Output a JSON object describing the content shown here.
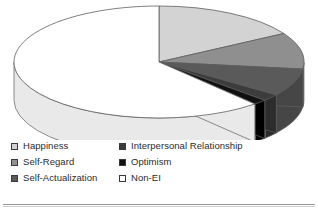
{
  "chart_data": {
    "type": "pie",
    "title": "",
    "three_d": true,
    "legend_position": "bottom",
    "categories": [
      "Happiness",
      "Self-Regard",
      "Self-Actualization",
      "Interpersonal Relationship",
      "Optimism",
      "Non-EI"
    ],
    "values": [
      16.5,
      10.5,
      8.0,
      2.0,
      1.5,
      61.5
    ],
    "unit": "percent",
    "colors": [
      "#d3d3d3",
      "#8f8f8f",
      "#5a5a5a",
      "#3c3c3c",
      "#111111",
      "#ffffff"
    ],
    "side_colors": [
      "#b5b5b5",
      "#737373",
      "#464646",
      "#2c2c2c",
      "#000000",
      "#e9e9e9"
    ],
    "start_angle_deg": -90,
    "direction": "clockwise",
    "outline_color": "#5e5e5e"
  },
  "legend": {
    "columns": [
      {
        "items": [
          {
            "label": "Happiness",
            "swatch": "#d3d3d3",
            "swatch_name": "legend-swatch-happiness"
          },
          {
            "label": "Self-Regard",
            "swatch": "#8f8f8f",
            "swatch_name": "legend-swatch-self-regard"
          },
          {
            "label": "Self-Actualization",
            "swatch": "#5a5a5a",
            "swatch_name": "legend-swatch-self-actualization"
          }
        ]
      },
      {
        "items": [
          {
            "label": "Interpersonal Relationship",
            "swatch": "#3c3c3c",
            "swatch_name": "legend-swatch-interpersonal-relationship"
          },
          {
            "label": "Optimism",
            "swatch": "#111111",
            "swatch_name": "legend-swatch-optimism"
          },
          {
            "label": "Non-EI",
            "swatch": "#ffffff",
            "swatch_name": "legend-swatch-non-ei"
          }
        ]
      }
    ]
  }
}
